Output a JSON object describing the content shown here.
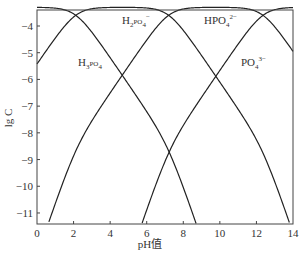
{
  "chart_data": {
    "type": "line",
    "title": "",
    "xlabel": "pH值",
    "ylabel": "lg C",
    "xlim": [
      0,
      14
    ],
    "ylim": [
      -11.4,
      -3.35
    ],
    "xticks": [
      0,
      2,
      4,
      6,
      8,
      10,
      12,
      14
    ],
    "yticks": [
      -4,
      -5,
      -6,
      -7,
      -8,
      -9,
      -10,
      -11
    ],
    "grid": false,
    "legend": "inline labels",
    "total_lgC": -3.3,
    "pKa": [
      2.12,
      7.2,
      12.36
    ],
    "series": [
      {
        "name": "H3PO4",
        "label_main": "H",
        "label_parts": [
          "H",
          "3",
          "PO",
          "4",
          ""
        ],
        "x": [
          0,
          1,
          2,
          2.12,
          3,
          4,
          5,
          6,
          7,
          8,
          8.6
        ],
        "y": [
          -3.33,
          -3.36,
          -3.57,
          -3.6,
          -4.15,
          -4.95,
          -5.88,
          -6.86,
          -7.86,
          -8.94,
          -9.68
        ]
      },
      {
        "name": "H2PO4-",
        "label_parts": [
          "H",
          "2",
          "PO",
          "4",
          "−"
        ],
        "x": [
          0,
          1,
          2,
          2.12,
          3,
          4,
          5,
          6,
          7,
          7.2,
          8,
          9,
          10,
          11,
          11.4
        ],
        "y": [
          -5.45,
          -4.46,
          -3.6,
          -3.6,
          -3.36,
          -3.31,
          -3.31,
          -3.33,
          -3.51,
          -3.6,
          -4.16,
          -5.1,
          -6.1,
          -7.1,
          -7.5
        ]
      },
      {
        "name": "HPO4^2-",
        "label_parts": [
          "HPO",
          "",
          "",
          "4",
          "2−"
        ],
        "x": [
          0.7,
          2,
          4,
          6,
          7,
          7.2,
          8,
          10,
          12,
          12.36,
          13,
          14
        ],
        "y": [
          -11.35,
          -10.0,
          -7.52,
          -5.53,
          -4.55,
          -3.6,
          -3.36,
          -3.3,
          -3.46,
          -3.6,
          -4.03,
          -4.95
        ]
      },
      {
        "name": "PO4^3-",
        "label_parts": [
          "PO",
          "",
          "",
          "4",
          "3−"
        ],
        "x": [
          5.8,
          7,
          7.2,
          8,
          10,
          12,
          12.36,
          13,
          14
        ],
        "y": [
          -11.35,
          -10.15,
          -9.1,
          -8.15,
          -6.3,
          -3.9,
          -3.6,
          -3.4,
          -3.32
        ]
      }
    ],
    "annotations": [
      {
        "text": "H2PO4−",
        "x": 5.0,
        "y": -3.9
      },
      {
        "text": "H3PO4",
        "x": 3.1,
        "y": -5.5
      },
      {
        "text": "HPO4 2−",
        "x": 9.8,
        "y": -3.9
      },
      {
        "text": "PO4 3−",
        "x": 11.9,
        "y": -5.2
      }
    ]
  }
}
